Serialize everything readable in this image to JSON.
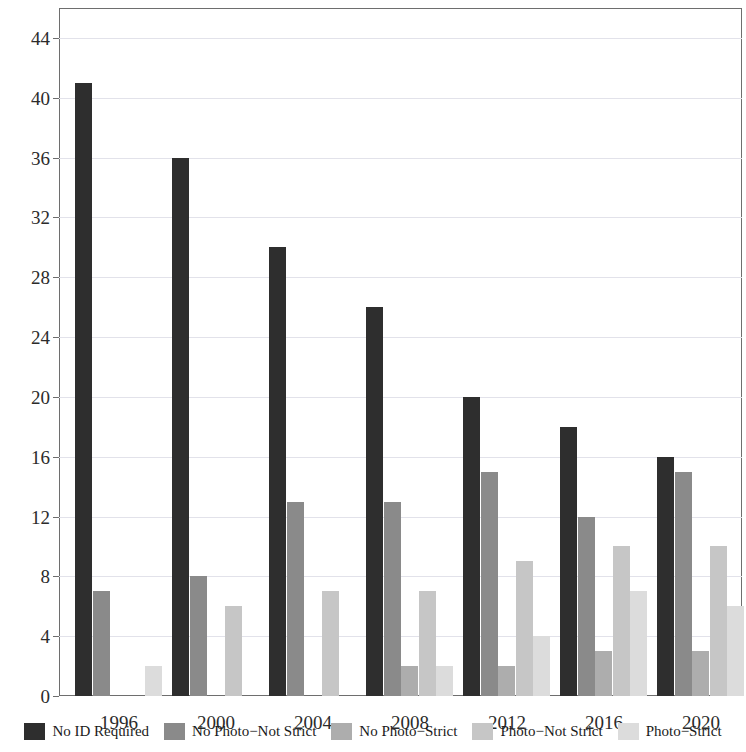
{
  "chart_data": {
    "type": "bar",
    "title": "",
    "subtitle": "",
    "xlabel": "",
    "ylabel": "",
    "categories": [
      "1996",
      "2000",
      "2004",
      "2008",
      "2012",
      "2016",
      "2020"
    ],
    "ylim": [
      0,
      46
    ],
    "yticks": [
      0,
      4,
      8,
      12,
      16,
      20,
      24,
      28,
      32,
      36,
      40,
      44
    ],
    "ytick_labels": [
      "0",
      "4",
      "8",
      "12",
      "16",
      "20",
      "24",
      "28",
      "32",
      "36",
      "40",
      "44"
    ],
    "grid": true,
    "grid_axis": "y",
    "legend_position": "bottom",
    "series": [
      {
        "name": "No ID Required",
        "color": "#2e2e2e",
        "values": [
          41,
          36,
          30,
          26,
          20,
          18,
          16
        ]
      },
      {
        "name": "No Photo−Not Strict",
        "color": "#8a8a8a",
        "values": [
          7,
          8,
          13,
          13,
          15,
          12,
          15
        ]
      },
      {
        "name": "No Photo−Strict",
        "color": "#adadad",
        "values": [
          0,
          0,
          0,
          2,
          2,
          3,
          3
        ]
      },
      {
        "name": "Photo−Not Strict",
        "color": "#c6c6c6",
        "values": [
          0,
          6,
          7,
          7,
          9,
          10,
          10
        ]
      },
      {
        "name": "Photo−Strict",
        "color": "#dcdcdc",
        "values": [
          2,
          0,
          0,
          2,
          4,
          7,
          6
        ]
      }
    ]
  },
  "axis": {
    "tick_color": "#6e6e6e",
    "grid_color": "#e2e2ea",
    "frame_color": "#6e6e6e"
  }
}
